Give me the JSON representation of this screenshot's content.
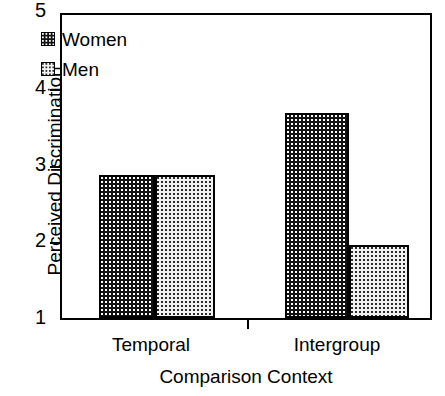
{
  "chart_data": {
    "type": "bar",
    "title": "",
    "xlabel": "Comparison Context",
    "ylabel": "Perceived Discrimination",
    "categories": [
      "Temporal",
      "Intergroup"
    ],
    "series": [
      {
        "name": "Women",
        "values": [
          2.86,
          3.67
        ],
        "swatch": "dark-dotted"
      },
      {
        "name": "Men",
        "values": [
          2.86,
          1.95
        ],
        "swatch": "light-dotted"
      }
    ],
    "ylim": [
      1,
      5
    ],
    "yticks": [
      1,
      2,
      3,
      4,
      5
    ],
    "ytick_labels": [
      "1",
      "2",
      "3",
      "4",
      "5"
    ],
    "grid": false,
    "legend_position": "top-left",
    "colors": {
      "bar_dark": "#121212",
      "bar_light": "#f2f2f2",
      "axis": "#000000",
      "background": "#ffffff"
    }
  },
  "legend": {
    "items": [
      {
        "label": "Women"
      },
      {
        "label": "Men"
      }
    ]
  },
  "axes": {
    "y_title": "Perceived Discrimination",
    "x_title": "Comparison Context",
    "y_tick_labels": [
      "5",
      "4",
      "3",
      "2",
      "1"
    ],
    "x_tick_labels": [
      "Temporal",
      "Intergroup"
    ]
  }
}
